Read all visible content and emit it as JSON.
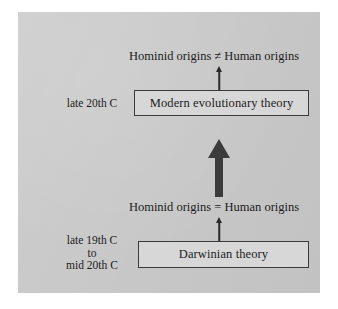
{
  "figure": {
    "panel": {
      "background_color": "#c9c9c9"
    },
    "colors": {
      "panel_background": "#c9c9c9",
      "box_fill": "#d7d7d7",
      "box_border": "#3a3a3a",
      "text": "#1c1c1c",
      "thin_arrow": "#2a2a2a",
      "thick_arrow": "#3b3b3b",
      "page_background": "#ffffff"
    },
    "statements": {
      "top": "Hominid origins ≠ Human origins",
      "bottom": "Hominid origins = Human origins"
    },
    "boxes": {
      "modern": "Modern evolutionary theory",
      "darwinian": "Darwinian theory"
    },
    "era_labels": {
      "late20": "late 20th C",
      "late19": "late 19th C\nto\nmid 20th C"
    },
    "arrows": {
      "transition": "thick-up-arrow",
      "modern_to_statement": "thin-up-arrow",
      "darwinian_to_statement": "thin-up-arrow"
    }
  }
}
